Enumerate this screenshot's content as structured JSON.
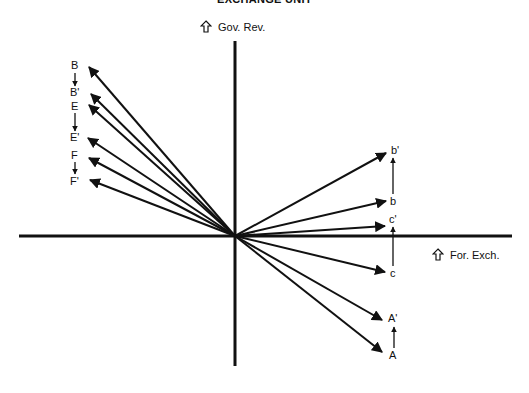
{
  "title": "EXCHANGE UNIT",
  "axes": {
    "vertical_label": "Gov. Rev.",
    "horizontal_label": "For. Exch.",
    "arrow_icon": "outline-up-arrow-icon"
  },
  "origin": {
    "x": 235,
    "y": 236
  },
  "vectors": [
    {
      "id": "B",
      "label": "B",
      "tip": [
        89,
        67
      ]
    },
    {
      "id": "B'",
      "label": "B'",
      "tip": [
        91,
        94
      ]
    },
    {
      "id": "E",
      "label": "E",
      "tip": [
        89,
        105
      ]
    },
    {
      "id": "E'",
      "label": "E'",
      "tip": [
        88,
        138
      ]
    },
    {
      "id": "F",
      "label": "F",
      "tip": [
        89,
        158
      ]
    },
    {
      "id": "F'",
      "label": "F'",
      "tip": [
        90,
        180
      ]
    },
    {
      "id": "b'",
      "label": "b'",
      "tip": [
        386,
        153
      ]
    },
    {
      "id": "b",
      "label": "b",
      "tip": [
        386,
        201
      ]
    },
    {
      "id": "c'",
      "label": "c'",
      "tip": [
        385,
        226
      ]
    },
    {
      "id": "c",
      "label": "c",
      "tip": [
        385,
        272
      ]
    },
    {
      "id": "A'",
      "label": "A'",
      "tip": [
        382,
        320
      ]
    },
    {
      "id": "A",
      "label": "A",
      "tip": [
        382,
        352
      ]
    }
  ],
  "shifts": [
    {
      "from": "B",
      "to": "B'",
      "direction": "down"
    },
    {
      "from": "E",
      "to": "E'",
      "direction": "down"
    },
    {
      "from": "F",
      "to": "F'",
      "direction": "down"
    },
    {
      "from": "b",
      "to": "b'",
      "direction": "up"
    },
    {
      "from": "c",
      "to": "c'",
      "direction": "up"
    },
    {
      "from": "A",
      "to": "A'",
      "direction": "up"
    }
  ],
  "labels": {
    "B": "B",
    "Bp": "B'",
    "E": "E",
    "Ep": "E'",
    "F": "F",
    "Fp": "F'",
    "bp": "b'",
    "b": "b",
    "cp": "c'",
    "c": "c",
    "Ap": "A'",
    "A": "A"
  }
}
